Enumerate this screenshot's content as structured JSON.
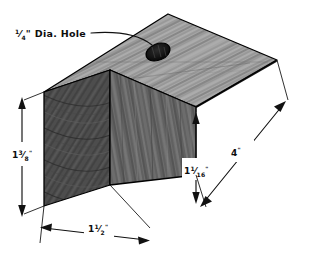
{
  "drawing": {
    "title": "Wood block isometric dimensioned drawing",
    "background_color": "#ffffff",
    "ink_color": "#111111",
    "annotations": {
      "hole_label": "¼\" Dia. Hole",
      "hole_label_parts": {
        "fraction_numerator": "1",
        "fraction_denominator": "4",
        "suffix": "\" Dia. Hole"
      }
    },
    "dimensions": [
      {
        "id": "height",
        "name": "left-vertical-dimension",
        "label": "1 3/8\"",
        "whole": "1",
        "numerator": "3",
        "denominator": "8",
        "unit": "\"",
        "value_inches": 1.375,
        "orientation": "vertical",
        "edge": "end-face-height"
      },
      {
        "id": "width",
        "name": "bottom-dimension",
        "label": "1 1/2\"",
        "whole": "1",
        "numerator": "1",
        "denominator": "2",
        "unit": "\"",
        "value_inches": 1.5,
        "orientation": "oblique-left",
        "edge": "end-face-width"
      },
      {
        "id": "step-height",
        "name": "right-vertical-dimension",
        "label": "1 1/16\"",
        "whole": "1",
        "numerator": "1",
        "denominator": "16",
        "unit": "\"",
        "value_inches": 1.0625,
        "orientation": "vertical",
        "edge": "front-face-height"
      },
      {
        "id": "length",
        "name": "right-diagonal-dimension",
        "label": "4\"",
        "whole": "4",
        "numerator": "",
        "denominator": "",
        "unit": "\"",
        "value_inches": 4,
        "orientation": "oblique-right",
        "edge": "block-length"
      }
    ],
    "features": [
      {
        "id": "hole",
        "name": "drilled-hole",
        "type": "through-hole",
        "diameter_label": "¼\"",
        "diameter_inches": 0.25,
        "location": "top-face"
      }
    ],
    "faces": [
      {
        "id": "end",
        "name": "end-grain-face",
        "shade": "#4a4a4a",
        "grain": "end-grain-arcs"
      },
      {
        "id": "front",
        "name": "front-face",
        "shade": "#6e6e6e",
        "grain": "vertical-streaks"
      },
      {
        "id": "top",
        "name": "top-face",
        "shade": "#9a9a9a",
        "grain": "diagonal-streaks"
      }
    ]
  }
}
